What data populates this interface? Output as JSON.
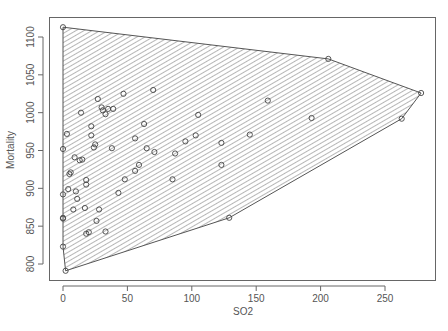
{
  "chart_data": {
    "type": "scatter",
    "title": "",
    "xlabel": "SO2",
    "ylabel": "Mortality",
    "xlim": [
      -10,
      288
    ],
    "ylim": [
      780,
      1120
    ],
    "xticks": [
      0,
      50,
      100,
      150,
      200,
      250
    ],
    "yticks": [
      800,
      850,
      900,
      950,
      1000,
      1050,
      1100
    ],
    "grid": false,
    "legend": null,
    "annotations": [
      "convex hull polygon shaded with diagonal hatch lines"
    ],
    "hull": [
      {
        "x": 0,
        "y": 1113
      },
      {
        "x": 206,
        "y": 1071
      },
      {
        "x": 278,
        "y": 1026
      },
      {
        "x": 263,
        "y": 992
      },
      {
        "x": 129,
        "y": 861
      },
      {
        "x": 2,
        "y": 791
      },
      {
        "x": 0,
        "y": 823
      }
    ],
    "points": [
      {
        "x": 0,
        "y": 1113
      },
      {
        "x": 206,
        "y": 1071
      },
      {
        "x": 278,
        "y": 1026
      },
      {
        "x": 263,
        "y": 992
      },
      {
        "x": 129,
        "y": 861
      },
      {
        "x": 2,
        "y": 791
      },
      {
        "x": 0,
        "y": 823
      },
      {
        "x": 0,
        "y": 861
      },
      {
        "x": 0,
        "y": 860
      },
      {
        "x": 0,
        "y": 892
      },
      {
        "x": 0,
        "y": 952
      },
      {
        "x": 3,
        "y": 972
      },
      {
        "x": 4,
        "y": 899
      },
      {
        "x": 5,
        "y": 919
      },
      {
        "x": 6,
        "y": 921
      },
      {
        "x": 8,
        "y": 872
      },
      {
        "x": 9,
        "y": 941
      },
      {
        "x": 10,
        "y": 896
      },
      {
        "x": 11,
        "y": 886
      },
      {
        "x": 13,
        "y": 937
      },
      {
        "x": 14,
        "y": 1000
      },
      {
        "x": 15,
        "y": 938
      },
      {
        "x": 17,
        "y": 874
      },
      {
        "x": 18,
        "y": 911
      },
      {
        "x": 18,
        "y": 905
      },
      {
        "x": 18,
        "y": 840
      },
      {
        "x": 20,
        "y": 842
      },
      {
        "x": 22,
        "y": 982
      },
      {
        "x": 22,
        "y": 970
      },
      {
        "x": 24,
        "y": 954
      },
      {
        "x": 25,
        "y": 958
      },
      {
        "x": 26,
        "y": 857
      },
      {
        "x": 27,
        "y": 1018
      },
      {
        "x": 28,
        "y": 872
      },
      {
        "x": 30,
        "y": 1007
      },
      {
        "x": 31,
        "y": 1003
      },
      {
        "x": 33,
        "y": 998
      },
      {
        "x": 33,
        "y": 843
      },
      {
        "x": 35,
        "y": 1005
      },
      {
        "x": 38,
        "y": 953
      },
      {
        "x": 39,
        "y": 1005
      },
      {
        "x": 43,
        "y": 894
      },
      {
        "x": 47,
        "y": 1025
      },
      {
        "x": 48,
        "y": 912
      },
      {
        "x": 56,
        "y": 966
      },
      {
        "x": 56,
        "y": 923
      },
      {
        "x": 59,
        "y": 931
      },
      {
        "x": 63,
        "y": 985
      },
      {
        "x": 65,
        "y": 953
      },
      {
        "x": 70,
        "y": 1030
      },
      {
        "x": 71,
        "y": 948
      },
      {
        "x": 85,
        "y": 912
      },
      {
        "x": 87,
        "y": 946
      },
      {
        "x": 95,
        "y": 962
      },
      {
        "x": 105,
        "y": 997
      },
      {
        "x": 103,
        "y": 970
      },
      {
        "x": 123,
        "y": 960
      },
      {
        "x": 123,
        "y": 931
      },
      {
        "x": 145,
        "y": 971
      },
      {
        "x": 159,
        "y": 1016
      },
      {
        "x": 193,
        "y": 993
      }
    ]
  }
}
